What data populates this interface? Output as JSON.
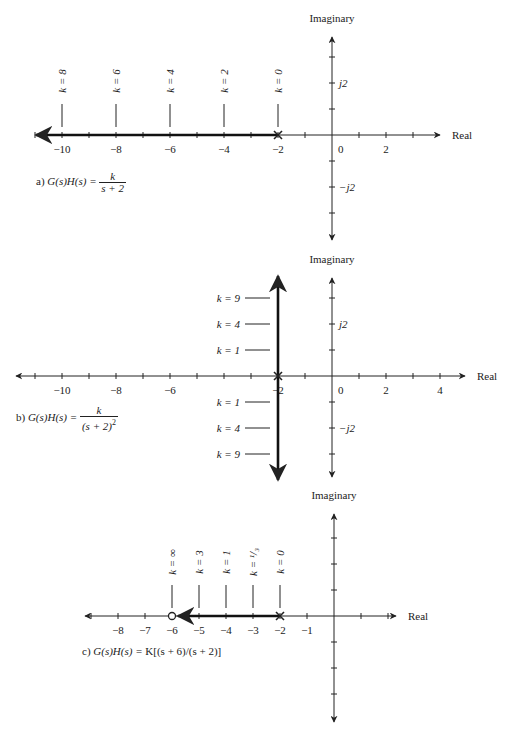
{
  "colors": {
    "ink": "#222222",
    "axis": "#333333",
    "locus": "#111111",
    "background": "#ffffff"
  },
  "diagrams": [
    {
      "id": "a",
      "caption_prefix": "a)",
      "caption_lhs": "G(s)H(s) =",
      "caption_num": "k",
      "caption_den": "s + 2",
      "imag_title": "Imaginary",
      "real_title": "Real",
      "origin": {
        "x": 332,
        "y": 135
      },
      "unit_px_x": 27,
      "unit_px_y": 26,
      "real_range": [
        -11,
        3
      ],
      "real_arrow_left_x": 36,
      "real_arrow_right_x": 440,
      "imag_arrow_top_y": 37,
      "imag_arrow_bottom_y": 240,
      "imag_ticks": [
        -3,
        -2,
        -1,
        1,
        2,
        3
      ],
      "real_tick_labels": [
        {
          "value": -10,
          "text": "−10"
        },
        {
          "value": -8,
          "text": "−8"
        },
        {
          "value": -6,
          "text": "−6"
        },
        {
          "value": -4,
          "text": "−4"
        },
        {
          "value": -2,
          "text": "−2"
        },
        {
          "value": 0,
          "text": "0"
        },
        {
          "value": 2,
          "text": "2"
        }
      ],
      "imag_tick_labels": [
        {
          "value": 2,
          "text": "j2"
        },
        {
          "value": -2,
          "text": "−j2"
        }
      ],
      "poles": [
        -2
      ],
      "zeros": [],
      "locus": {
        "type": "horizontal",
        "from": -2,
        "to_x_px": 36
      },
      "k_markers": {
        "orientation": "vertical",
        "items": [
          {
            "at": -10,
            "text": "k = 8"
          },
          {
            "at": -8,
            "text": "k = 6"
          },
          {
            "at": -6,
            "text": "k = 4"
          },
          {
            "at": -4,
            "text": "k = 2"
          },
          {
            "at": -2,
            "text": "k = 0"
          }
        ]
      },
      "caption_pos": {
        "x": 36,
        "y": 184
      }
    },
    {
      "id": "b",
      "caption_prefix": "b)",
      "caption_lhs": "G(s)H(s) =",
      "caption_num": "k",
      "caption_den": "(s + 2)",
      "caption_den_exp": "2",
      "imag_title": "Imaginary",
      "real_title": "Real",
      "origin": {
        "x": 332,
        "y": 376
      },
      "unit_px_x": 27,
      "unit_px_y": 26,
      "real_range": [
        -11,
        4
      ],
      "real_arrow_left_x": 16,
      "real_arrow_right_x": 465,
      "imag_arrow_top_y": 278,
      "imag_arrow_bottom_y": 477,
      "imag_ticks": [
        -3,
        -2,
        -1,
        1,
        2,
        3
      ],
      "real_tick_labels": [
        {
          "value": -10,
          "text": "−10"
        },
        {
          "value": -8,
          "text": "−8"
        },
        {
          "value": -6,
          "text": "−6"
        },
        {
          "value": -2,
          "text": "−2"
        },
        {
          "value": 0,
          "text": "0"
        },
        {
          "value": 2,
          "text": "2"
        },
        {
          "value": 4,
          "text": "4"
        }
      ],
      "imag_tick_labels": [
        {
          "value": 2,
          "text": "j2"
        },
        {
          "value": -2,
          "text": "−j2"
        }
      ],
      "poles": [
        -2
      ],
      "zeros": [],
      "locus": {
        "type": "vertical",
        "at": -2,
        "top_y": 276,
        "bottom_y": 480
      },
      "k_markers": {
        "orientation": "horizontal",
        "items": [
          {
            "imag": 3,
            "text": "k = 9"
          },
          {
            "imag": 2,
            "text": "k = 4"
          },
          {
            "imag": 1,
            "text": "k = 1"
          },
          {
            "imag": -1,
            "text": "k = 1"
          },
          {
            "imag": -2,
            "text": "k = 4"
          },
          {
            "imag": -3,
            "text": "k = 9"
          }
        ]
      },
      "caption_pos": {
        "x": 16,
        "y": 418
      }
    },
    {
      "id": "c",
      "caption_prefix": "c)",
      "caption_lhs": "G(s)H(s) =",
      "caption_rest": "K[(s + 6)/(s + 2)]",
      "imag_title": "Imaginary",
      "real_title": "Real",
      "origin": {
        "x": 334,
        "y": 616
      },
      "unit_px_x": 27,
      "unit_px_y": 26,
      "real_range": [
        -9,
        2
      ],
      "real_arrow_left_x": 85,
      "real_arrow_right_x": 396,
      "imag_arrow_top_y": 514,
      "imag_arrow_bottom_y": 722,
      "imag_ticks": [
        -3,
        -2,
        -1,
        1,
        2,
        3
      ],
      "real_tick_labels": [
        {
          "value": -8,
          "text": "−8"
        },
        {
          "value": -7,
          "text": "−7"
        },
        {
          "value": -6,
          "text": "−6"
        },
        {
          "value": -5,
          "text": "−5"
        },
        {
          "value": -4,
          "text": "−4"
        },
        {
          "value": -3,
          "text": "−3"
        },
        {
          "value": -2,
          "text": "−2"
        },
        {
          "value": -1,
          "text": "−1"
        }
      ],
      "imag_tick_labels": [],
      "poles": [
        -2
      ],
      "zeros": [
        -6
      ],
      "locus": {
        "type": "horizontal",
        "from": -2,
        "to": -6
      },
      "k_markers": {
        "orientation": "vertical",
        "items": [
          {
            "at": -6,
            "text": "k = ∞"
          },
          {
            "at": -5,
            "text": "k = 3"
          },
          {
            "at": -4,
            "text": "k = 1"
          },
          {
            "at": -3,
            "text": "k = ¹/₃"
          },
          {
            "at": -2,
            "text": "k = 0"
          }
        ]
      },
      "caption_pos": {
        "x": 82,
        "y": 658
      }
    }
  ]
}
